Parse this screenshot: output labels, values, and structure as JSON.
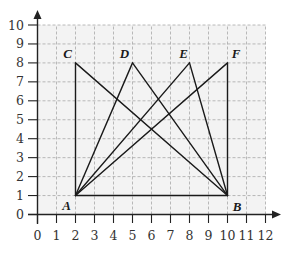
{
  "diagram": {
    "type": "coordinate-grid",
    "x_axis": {
      "min": 0,
      "max": 12,
      "ticks": [
        "0",
        "1",
        "2",
        "3",
        "4",
        "5",
        "6",
        "7",
        "8",
        "9",
        "10",
        "11",
        "12"
      ]
    },
    "y_axis": {
      "min": 0,
      "max": 10,
      "ticks": [
        "0",
        "1",
        "2",
        "3",
        "4",
        "5",
        "6",
        "7",
        "8",
        "9",
        "10"
      ]
    },
    "points": [
      {
        "label": "A",
        "x": 2,
        "y": 1
      },
      {
        "label": "B",
        "x": 10,
        "y": 1
      },
      {
        "label": "C",
        "x": 2,
        "y": 8
      },
      {
        "label": "D",
        "x": 5,
        "y": 8
      },
      {
        "label": "E",
        "x": 8,
        "y": 8
      },
      {
        "label": "F",
        "x": 10,
        "y": 8
      }
    ],
    "segments": [
      [
        "A",
        "B"
      ],
      [
        "A",
        "C"
      ],
      [
        "A",
        "D"
      ],
      [
        "A",
        "E"
      ],
      [
        "A",
        "F"
      ],
      [
        "B",
        "C"
      ],
      [
        "B",
        "D"
      ],
      [
        "B",
        "E"
      ],
      [
        "B",
        "F"
      ]
    ],
    "colors": {
      "line": "#1a1a1a",
      "grid": "#a8a8a8",
      "background": "#f3f3f3",
      "axis": "#222222"
    }
  }
}
